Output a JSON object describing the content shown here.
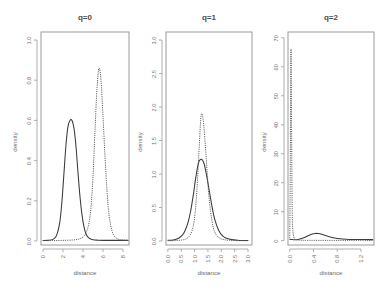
{
  "figure": {
    "kind": "multi-panel-density-plot",
    "panel_count": 3,
    "shared_xlabel": "distance",
    "shared_ylabel": "density"
  },
  "chart_data": [
    {
      "type": "line",
      "title": "q=0",
      "xlabel": "distance",
      "ylabel": "density",
      "xlim": [
        -0.2,
        8.6
      ],
      "ylim": [
        -0.02,
        1.04
      ],
      "xticks": [
        "0",
        "2",
        "4",
        "6",
        "8"
      ],
      "xtick_values": [
        0,
        2,
        4,
        6,
        8
      ],
      "yticks": [
        "0.0",
        "0.2",
        "0.4",
        "0.6",
        "0.8",
        "1.0"
      ],
      "ytick_values": [
        0.0,
        0.2,
        0.4,
        0.6,
        0.8,
        1.0
      ],
      "grid": false,
      "legend": "none",
      "series": [
        {
          "name": "solid",
          "style": "solid",
          "peak_x": 2.9,
          "peak_y": 0.6,
          "x": [
            0.0,
            0.5,
            1.0,
            1.3,
            1.5,
            1.7,
            1.9,
            2.1,
            2.3,
            2.5,
            2.7,
            2.9,
            3.1,
            3.3,
            3.5,
            3.7,
            3.9,
            4.1,
            4.3,
            4.6,
            5.0,
            5.5,
            6.0,
            7.0,
            8.0,
            8.5
          ],
          "values": [
            0.002,
            0.003,
            0.008,
            0.022,
            0.05,
            0.1,
            0.2,
            0.34,
            0.48,
            0.57,
            0.6,
            0.6,
            0.56,
            0.47,
            0.34,
            0.22,
            0.13,
            0.07,
            0.035,
            0.014,
            0.006,
            0.004,
            0.003,
            0.003,
            0.003,
            0.003
          ]
        },
        {
          "name": "dashed",
          "style": "dashed",
          "peak_x": 5.6,
          "peak_y": 0.86,
          "x": [
            0.0,
            1.0,
            2.0,
            3.0,
            3.6,
            4.0,
            4.3,
            4.6,
            4.8,
            5.0,
            5.2,
            5.4,
            5.6,
            5.8,
            6.0,
            6.2,
            6.4,
            6.6,
            6.9,
            7.2,
            7.6,
            8.0,
            8.5
          ],
          "values": [
            0.002,
            0.002,
            0.003,
            0.005,
            0.01,
            0.02,
            0.04,
            0.09,
            0.17,
            0.32,
            0.55,
            0.76,
            0.86,
            0.8,
            0.62,
            0.42,
            0.25,
            0.13,
            0.05,
            0.02,
            0.008,
            0.004,
            0.003
          ]
        }
      ]
    },
    {
      "type": "line",
      "title": "q=1",
      "xlabel": "distance",
      "ylabel": "density",
      "xlim": [
        -0.07,
        3.15
      ],
      "ylim": [
        -0.06,
        3.12
      ],
      "xticks": [
        "0.0",
        "0.5",
        "1.0",
        "1.5",
        "2.0",
        "2.5",
        "3.0"
      ],
      "xtick_values": [
        0.0,
        0.5,
        1.0,
        1.5,
        2.0,
        2.5,
        3.0
      ],
      "yticks": [
        "0.0",
        "0.5",
        "1.0",
        "1.5",
        "2.0",
        "2.5",
        "3.0"
      ],
      "ytick_values": [
        0.0,
        0.5,
        1.0,
        1.5,
        2.0,
        2.5,
        3.0
      ],
      "grid": false,
      "legend": "none",
      "series": [
        {
          "name": "solid",
          "style": "solid",
          "peak_x": 1.25,
          "peak_y": 1.22,
          "x": [
            0.0,
            0.2,
            0.4,
            0.55,
            0.65,
            0.75,
            0.85,
            0.95,
            1.05,
            1.15,
            1.25,
            1.35,
            1.45,
            1.55,
            1.65,
            1.75,
            1.9,
            2.05,
            2.2,
            2.4,
            2.6,
            2.8,
            3.0
          ],
          "values": [
            0.01,
            0.015,
            0.04,
            0.09,
            0.16,
            0.27,
            0.44,
            0.68,
            0.96,
            1.17,
            1.22,
            1.16,
            0.98,
            0.75,
            0.52,
            0.33,
            0.16,
            0.075,
            0.04,
            0.02,
            0.012,
            0.008,
            0.006
          ]
        },
        {
          "name": "dashed",
          "style": "dashed",
          "peak_x": 1.26,
          "peak_y": 1.9,
          "x": [
            0.0,
            0.3,
            0.6,
            0.75,
            0.85,
            0.95,
            1.02,
            1.09,
            1.16,
            1.22,
            1.26,
            1.32,
            1.38,
            1.45,
            1.52,
            1.6,
            1.7,
            1.82,
            1.95,
            2.1,
            2.3,
            2.6,
            3.0
          ],
          "values": [
            0.005,
            0.006,
            0.02,
            0.05,
            0.1,
            0.22,
            0.42,
            0.78,
            1.3,
            1.75,
            1.9,
            1.82,
            1.55,
            1.15,
            0.75,
            0.44,
            0.2,
            0.085,
            0.04,
            0.02,
            0.01,
            0.006,
            0.004
          ]
        }
      ]
    },
    {
      "type": "line",
      "title": "q=2",
      "xlabel": "distance",
      "ylabel": "density",
      "xlim": [
        -0.03,
        1.42
      ],
      "ylim": [
        -1.5,
        72
      ],
      "xticks": [
        "0.0",
        "0.4",
        "0.8",
        "1.2"
      ],
      "xtick_values": [
        0.0,
        0.4,
        0.8,
        1.2
      ],
      "yticks": [
        "0",
        "10",
        "20",
        "30",
        "40",
        "50",
        "60",
        "70"
      ],
      "ytick_values": [
        0,
        10,
        20,
        30,
        40,
        50,
        60,
        70
      ],
      "grid": false,
      "legend": "none",
      "series": [
        {
          "name": "solid",
          "style": "solid",
          "peak_x": 0.43,
          "peak_y": 2.5,
          "x": [
            0.0,
            0.03,
            0.08,
            0.14,
            0.2,
            0.26,
            0.32,
            0.38,
            0.43,
            0.48,
            0.54,
            0.6,
            0.68,
            0.76,
            0.85,
            0.95,
            1.05,
            1.2,
            1.35,
            1.4
          ],
          "values": [
            0.5,
            0.4,
            0.3,
            0.4,
            0.7,
            1.2,
            1.8,
            2.3,
            2.5,
            2.45,
            2.2,
            1.8,
            1.3,
            0.9,
            0.65,
            0.5,
            0.42,
            0.38,
            0.36,
            0.35
          ]
        },
        {
          "name": "dashed",
          "style": "dashed",
          "peak_x": 0.02,
          "peak_y": 66,
          "x": [
            0.0,
            0.01,
            0.02,
            0.03,
            0.04,
            0.05,
            0.07,
            0.1,
            0.2,
            0.5,
            1.0,
            1.4
          ],
          "values": [
            1.0,
            30.0,
            66.0,
            40.0,
            12.0,
            4.0,
            1.2,
            0.4,
            0.15,
            0.1,
            0.1,
            0.1
          ]
        }
      ]
    }
  ]
}
